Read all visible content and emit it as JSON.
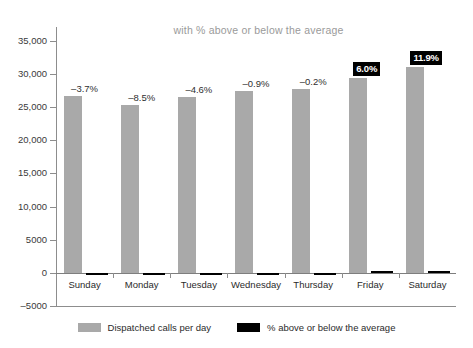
{
  "chart_data": {
    "type": "bar",
    "title": "with % above or below the average",
    "xlabel": "",
    "ylabel": "",
    "ylim": [
      -5000,
      35000
    ],
    "ytick_labels": [
      "35,000",
      "30,000",
      "25,000",
      "20,000",
      "15,000",
      "10,000",
      "5000",
      "0",
      "-5000"
    ],
    "ytick_values": [
      35000,
      30000,
      25000,
      20000,
      15000,
      10000,
      5000,
      0,
      -5000
    ],
    "grid": false,
    "legend_position": "bottom",
    "categories": [
      "Sunday",
      "Monday",
      "Tuesday",
      "Wednesday",
      "Thursday",
      "Friday",
      "Saturday"
    ],
    "series": [
      {
        "name": "Dispatched calls per day",
        "color": "#a9a9a9",
        "values": [
          26700,
          25350,
          26450,
          27450,
          27650,
          29350,
          31000
        ]
      },
      {
        "name": "% above or below the average",
        "color": "#000000",
        "values": [
          -3.7,
          -8.5,
          -4.6,
          -0.9,
          -0.2,
          6.0,
          11.9
        ]
      }
    ],
    "data_labels": [
      {
        "text": "-3.7%",
        "style": "plain"
      },
      {
        "text": "-8.5%",
        "style": "plain"
      },
      {
        "text": "-4.6%",
        "style": "plain"
      },
      {
        "text": "-0.9%",
        "style": "plain"
      },
      {
        "text": "-0.2%",
        "style": "plain"
      },
      {
        "text": "6.0%",
        "style": "badge"
      },
      {
        "text": "11.9%",
        "style": "badge"
      }
    ]
  },
  "legend": {
    "items": [
      {
        "label": "Dispatched calls per day",
        "swatch": "gray"
      },
      {
        "label": "% above or below the average",
        "swatch": "black"
      }
    ]
  }
}
